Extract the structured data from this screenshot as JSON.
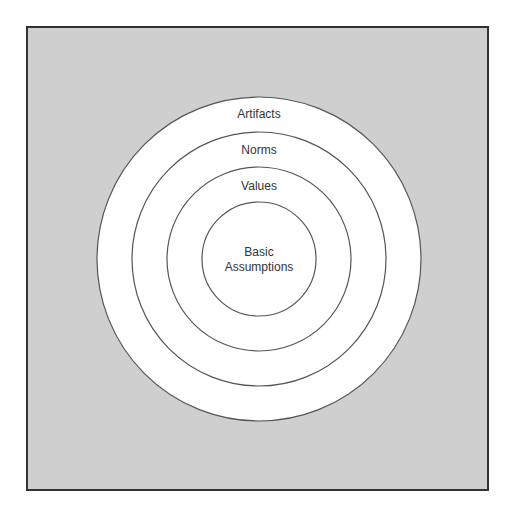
{
  "diagram": {
    "type": "concentric-circles",
    "background_color": "#cfcfcf",
    "border_color": "#333333",
    "ring_fill": "#ffffff",
    "ring_stroke": "#555555",
    "layers": [
      {
        "label": "Artifacts",
        "radius": 162
      },
      {
        "label": "Norms",
        "radius": 127
      },
      {
        "label": "Values",
        "radius": 92
      },
      {
        "label_line1": "Basic",
        "label_line2": "Assumptions",
        "radius": 57
      }
    ]
  }
}
